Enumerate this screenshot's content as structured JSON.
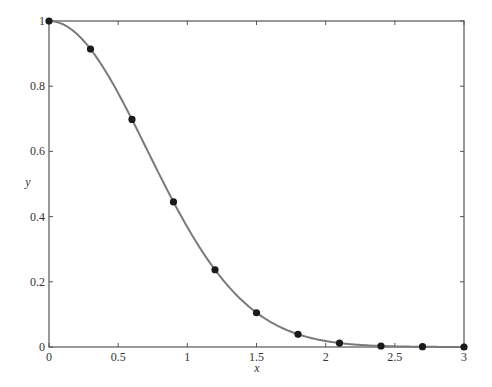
{
  "chart_data": {
    "type": "line",
    "title": "",
    "xlabel": "x",
    "ylabel": "y",
    "xlim": [
      0,
      3
    ],
    "ylim": [
      0,
      1
    ],
    "grid": false,
    "legend": null,
    "x_ticks": [
      0,
      0.5,
      1,
      1.5,
      2,
      2.5,
      3
    ],
    "x_tick_labels": [
      "0",
      "0.5",
      "1",
      "1.5",
      "2",
      "2.5",
      "3"
    ],
    "y_ticks": [
      0,
      0.2,
      0.4,
      0.6,
      0.8,
      1
    ],
    "y_tick_labels": [
      "0",
      "0.2",
      "0.4",
      "0.6",
      "0.8",
      "1"
    ],
    "series": [
      {
        "name": "curve",
        "style": "smooth line",
        "color": "#7a7a7a",
        "function_hint": "exp(-x^2)"
      },
      {
        "name": "points",
        "style": "markers",
        "color": "#1a1a1a",
        "x": [
          0,
          0.3,
          0.6,
          0.9,
          1.2,
          1.5,
          1.8,
          2.1,
          2.4,
          2.7,
          3.0
        ],
        "values": [
          1.0,
          0.914,
          0.698,
          0.445,
          0.237,
          0.105,
          0.039,
          0.012,
          0.003,
          0.001,
          0.0
        ]
      }
    ]
  },
  "colors": {
    "axis": "#555555",
    "curve": "#7a7a7a",
    "marker": "#1a1a1a",
    "background": "#ffffff"
  }
}
